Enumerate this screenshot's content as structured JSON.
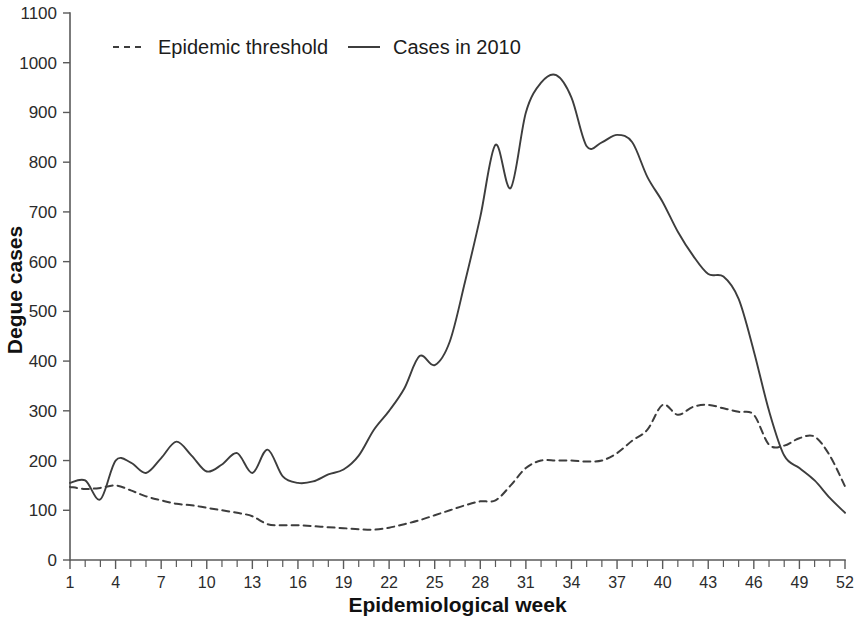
{
  "chart_data": {
    "type": "line",
    "title": "",
    "xlabel": "Epidemiological week",
    "ylabel": "Degue cases",
    "xlim": [
      1,
      52
    ],
    "ylim": [
      0,
      1100
    ],
    "y_ticks": [
      0,
      100,
      200,
      300,
      400,
      500,
      600,
      700,
      800,
      900,
      1000,
      1100
    ],
    "x_ticks": [
      1,
      4,
      7,
      10,
      13,
      16,
      19,
      22,
      25,
      28,
      31,
      34,
      37,
      40,
      43,
      46,
      49,
      52
    ],
    "x_minor_step": 1,
    "grid": false,
    "legend_position": "top-left-inside",
    "line_color": "#3d3d3d",
    "axis_color": "#5a5a5a",
    "x": [
      1,
      2,
      3,
      4,
      5,
      6,
      7,
      8,
      9,
      10,
      11,
      12,
      13,
      14,
      15,
      16,
      17,
      18,
      19,
      20,
      21,
      22,
      23,
      24,
      25,
      26,
      27,
      28,
      29,
      30,
      31,
      32,
      33,
      34,
      35,
      36,
      37,
      38,
      39,
      40,
      41,
      42,
      43,
      44,
      45,
      46,
      47,
      48,
      49,
      50,
      51,
      52
    ],
    "series": [
      {
        "name": "Epidemic threshold",
        "style": "dashed",
        "values": [
          147,
          143,
          145,
          150,
          140,
          128,
          120,
          113,
          110,
          105,
          100,
          95,
          88,
          72,
          70,
          70,
          68,
          66,
          64,
          62,
          61,
          65,
          72,
          80,
          90,
          100,
          110,
          118,
          120,
          150,
          185,
          200,
          200,
          200,
          198,
          200,
          215,
          240,
          262,
          312,
          292,
          308,
          312,
          305,
          298,
          292,
          232,
          230,
          245,
          248,
          210,
          148
        ]
      },
      {
        "name": "Cases in 2010",
        "style": "solid",
        "values": [
          155,
          160,
          122,
          200,
          196,
          175,
          205,
          238,
          210,
          178,
          192,
          215,
          175,
          222,
          168,
          155,
          158,
          172,
          182,
          210,
          262,
          300,
          345,
          410,
          392,
          440,
          560,
          690,
          835,
          748,
          900,
          960,
          975,
          930,
          832,
          840,
          855,
          840,
          770,
          720,
          660,
          612,
          575,
          570,
          525,
          420,
          300,
          210,
          185,
          160,
          125,
          95
        ]
      }
    ],
    "legend": [
      {
        "label": "Epidemic threshold",
        "style": "dashed"
      },
      {
        "label": "Cases in 2010",
        "style": "solid"
      }
    ]
  }
}
